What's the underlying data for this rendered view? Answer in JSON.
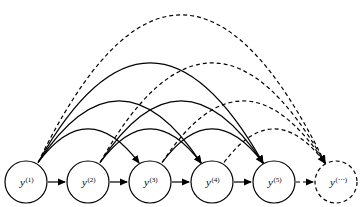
{
  "figure": {
    "title": "",
    "background_color": "#ffffff",
    "stroke_color": "#000000",
    "width": 360,
    "height": 207
  },
  "nodes": [
    {
      "id": "y1",
      "base": "y",
      "superscript": "(1)",
      "cx": 26,
      "cy": 182,
      "r": 21,
      "style": "solid"
    },
    {
      "id": "y2",
      "base": "y",
      "superscript": "(2)",
      "cx": 88,
      "cy": 182,
      "r": 21,
      "style": "solid"
    },
    {
      "id": "y3",
      "base": "y",
      "superscript": "(3)",
      "cx": 150,
      "cy": 182,
      "r": 21,
      "style": "solid"
    },
    {
      "id": "y4",
      "base": "y",
      "superscript": "(4)",
      "cx": 212,
      "cy": 182,
      "r": 21,
      "style": "solid"
    },
    {
      "id": "y5",
      "base": "y",
      "superscript": "(5)",
      "cx": 274,
      "cy": 182,
      "r": 21,
      "style": "solid"
    },
    {
      "id": "ydots",
      "base": "y",
      "superscript": "(⋯)",
      "cx": 336,
      "cy": 182,
      "r": 21,
      "style": "dashed"
    }
  ],
  "edges": {
    "chain_label": "sequential next-token arrows",
    "chain": [
      {
        "from": "y1",
        "to": "y2",
        "style": "solid"
      },
      {
        "from": "y2",
        "to": "y3",
        "style": "solid"
      },
      {
        "from": "y3",
        "to": "y4",
        "style": "solid"
      },
      {
        "from": "y4",
        "to": "y5",
        "style": "solid"
      },
      {
        "from": "y5",
        "to": "ydots",
        "style": "dashed"
      }
    ],
    "arcs_label": "long-range dependency arcs",
    "arcs": [
      {
        "from": "y1",
        "to": "y3",
        "style": "solid",
        "apex_y": 128
      },
      {
        "from": "y1",
        "to": "y4",
        "style": "solid",
        "apex_y": 100
      },
      {
        "from": "y1",
        "to": "y5",
        "style": "solid",
        "apex_y": 62
      },
      {
        "from": "y1",
        "to": "ydots",
        "style": "dashed",
        "apex_y": 14
      },
      {
        "from": "y2",
        "to": "y4",
        "style": "solid",
        "apex_y": 128
      },
      {
        "from": "y2",
        "to": "y5",
        "style": "solid",
        "apex_y": 100
      },
      {
        "from": "y2",
        "to": "ydots",
        "style": "dashed",
        "apex_y": 62
      },
      {
        "from": "y3",
        "to": "y5",
        "style": "solid",
        "apex_y": 128
      },
      {
        "from": "y3",
        "to": "ydots",
        "style": "dashed",
        "apex_y": 100
      },
      {
        "from": "y4",
        "to": "ydots",
        "style": "dashed",
        "apex_y": 128
      }
    ]
  },
  "style_tokens": {
    "dash_pattern": "4,3",
    "stroke_width": 1.2,
    "arrowhead": "filled-triangle"
  }
}
